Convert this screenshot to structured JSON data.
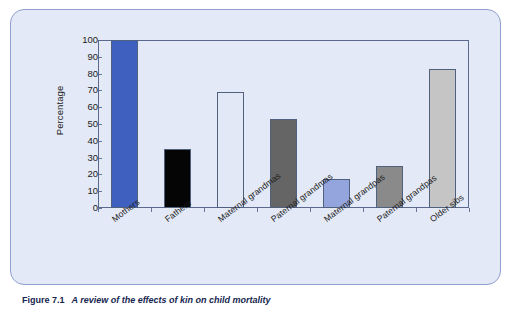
{
  "figure": {
    "caption_label": "Figure 7.1",
    "caption_text": "A review of the effects of kin on child mortality",
    "panel_bg": "#e3e9f6",
    "panel_border": "#8fa0ce"
  },
  "chart_data": {
    "type": "bar",
    "title": "",
    "xlabel": "",
    "ylabel": "Percentage",
    "ylim": [
      0,
      100
    ],
    "yticks": [
      0,
      10,
      20,
      30,
      40,
      50,
      60,
      70,
      80,
      90,
      100
    ],
    "ytick_labels": [
      "0",
      "10",
      "20",
      "30",
      "40",
      "50",
      "60",
      "70",
      "80",
      "90",
      "100"
    ],
    "grid": false,
    "legend": "none",
    "categories": [
      "Mothers",
      "Fathers",
      "Maternal grandmas",
      "Paternal grandmas",
      "Maternal grandpas",
      "Paternal grandpas",
      "Older sibs"
    ],
    "values": [
      100,
      35,
      69,
      53,
      17,
      25,
      83
    ],
    "bar_colors": [
      "#4060bf",
      "#050505",
      "#e2e8f6",
      "#656565",
      "#93a5dc",
      "#8a8a8a",
      "#c5c5c5"
    ],
    "bar_edge_color": "#50607f",
    "axis_color": "#5b6a8c"
  }
}
